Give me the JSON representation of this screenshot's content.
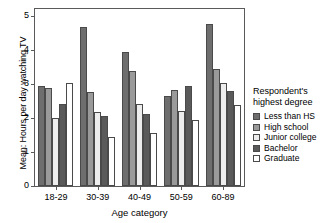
{
  "chart_data": {
    "type": "bar",
    "title": "",
    "xlabel": "Age category",
    "ylabel": "Mean: Hours per day watching TV",
    "ylim": [
      0,
      5.2
    ],
    "yticks": [
      0,
      1,
      2,
      3,
      4,
      5
    ],
    "ytick_labels": [
      "0",
      "1",
      "2",
      "3",
      "4",
      "5"
    ],
    "grid": false,
    "legend_position": "right",
    "legend_title_line1": "Respondent's",
    "legend_title_line2": "highest degree",
    "categories": [
      "18-29",
      "30-39",
      "40-49",
      "50-59",
      "60-89"
    ],
    "series": [
      {
        "name": "Less than HS",
        "color": "#6e6e6e",
        "values": [
          2.95,
          4.66,
          3.95,
          2.63,
          4.75
        ]
      },
      {
        "name": "High school",
        "color": "#9a9a9a",
        "values": [
          2.88,
          2.75,
          3.38,
          2.82,
          3.43
        ]
      },
      {
        "name": "Junior college",
        "color": "#ededed",
        "values": [
          2.0,
          2.18,
          2.4,
          2.2,
          3.02
        ]
      },
      {
        "name": "Bachelor",
        "color": "#5a5a5a",
        "values": [
          2.42,
          2.06,
          2.13,
          2.93,
          2.8
        ]
      },
      {
        "name": "Graduate",
        "color": "#ffffff",
        "values": [
          3.02,
          1.45,
          1.57,
          1.95,
          2.38
        ]
      }
    ]
  }
}
